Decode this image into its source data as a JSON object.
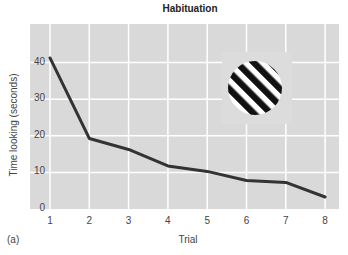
{
  "chart_data": {
    "type": "line",
    "title": "Habituation",
    "xlabel": "Trial",
    "ylabel": "Time looking (seconds)",
    "panel_label": "(a)",
    "x": [
      1,
      2,
      3,
      4,
      5,
      6,
      7,
      8
    ],
    "x_ticks": [
      "1",
      "2",
      "3",
      "4",
      "5",
      "6",
      "7",
      "8"
    ],
    "y_ticks": [
      "0",
      "10",
      "20",
      "30",
      "40"
    ],
    "ylim": [
      0,
      45
    ],
    "grid": true,
    "series": [
      {
        "name": "Time looking",
        "values": [
          41,
          19,
          16,
          11.5,
          10,
          7.5,
          7,
          3
        ],
        "color": "#333333"
      }
    ],
    "annotations": [
      {
        "type": "image",
        "description": "circle with diagonal black and white stripes (stimulus)"
      }
    ]
  },
  "colors": {
    "plot_background": "#d9d9d9",
    "grid": "#ffffff",
    "line": "#333333"
  }
}
